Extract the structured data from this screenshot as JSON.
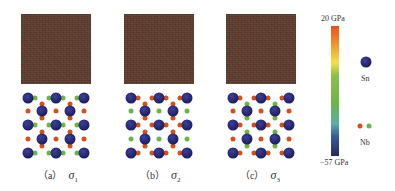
{
  "panels": [
    {
      "id": "a",
      "label": "（a）",
      "symbol": "σ",
      "subscript": "1"
    },
    {
      "id": "b",
      "label": "（b）",
      "symbol": "σ",
      "subscript": "2"
    },
    {
      "id": "c",
      "label": "（c）",
      "symbol": "σ",
      "subscript": "3"
    }
  ],
  "colorbar": {
    "max_label": "20 GPa",
    "min_label": "−57 GPa",
    "max_value": 20,
    "min_value": -57,
    "unit": "GPa",
    "colors": [
      "#e8501e",
      "#f5e04a",
      "#6cb44a",
      "#5ab0a8",
      "#25285e"
    ]
  },
  "legend": {
    "sn_label": "Sn",
    "nb_label": "Nb",
    "sn_color": "#1e1f5e",
    "nb_colors": [
      "#d2521e",
      "#6cb44a"
    ]
  }
}
